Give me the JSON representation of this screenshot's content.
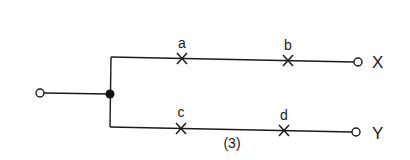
{
  "diagram": {
    "type": "parallel-branch-circuit",
    "figure_number": "(3)",
    "input_terminal": {
      "shape": "open-circle"
    },
    "junction": {
      "shape": "filled-dot"
    },
    "branches": [
      {
        "id": "top",
        "output_label": "X",
        "cut_points": [
          {
            "label": "a",
            "mark": "cross"
          },
          {
            "label": "b",
            "mark": "cross"
          }
        ]
      },
      {
        "id": "bottom",
        "output_label": "Y",
        "cut_points": [
          {
            "label": "c",
            "mark": "cross"
          },
          {
            "label": "d",
            "mark": "cross"
          }
        ]
      }
    ],
    "colors": {
      "line": "#1a1a1a",
      "background": "#ffffff"
    }
  }
}
